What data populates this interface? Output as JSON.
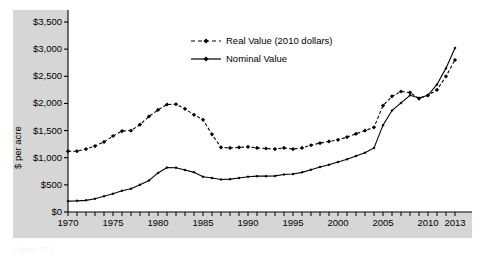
{
  "figure": {
    "panel_color": "#d6d6d6",
    "plot_bg": "#ffffff",
    "line_color": "#000000",
    "caption": "Figure 22.1"
  },
  "legend": {
    "position": "top-center",
    "entries": [
      {
        "label": "Real Value (2010 dollars)",
        "style": "dashed",
        "marker": "diamond"
      },
      {
        "label": "Nominal Value",
        "style": "solid",
        "marker": "diamond"
      }
    ]
  },
  "axes": {
    "ylabel": "$ per acre",
    "yticks": [
      "$0",
      "$500",
      "$1,000",
      "$1,500",
      "$2,000",
      "$2,500",
      "$3,000",
      "$3,500"
    ],
    "xticks": [
      "1970",
      "1975",
      "1980",
      "1985",
      "1990",
      "1995",
      "2000",
      "2005",
      "2010",
      "2013"
    ]
  },
  "chart_data": {
    "type": "line",
    "title": "",
    "xlabel": "",
    "ylabel": "$ per acre",
    "xlim": [
      1970,
      2013
    ],
    "ylim": [
      0,
      3500
    ],
    "ytick_values": [
      0,
      500,
      1000,
      1500,
      2000,
      2500,
      3000,
      3500
    ],
    "xtick_values": [
      1970,
      1975,
      1980,
      1985,
      1990,
      1995,
      2000,
      2005,
      2010,
      2013
    ],
    "grid": false,
    "legend_position": "top-center",
    "x": [
      1970,
      1971,
      1972,
      1973,
      1974,
      1975,
      1976,
      1977,
      1978,
      1979,
      1980,
      1981,
      1982,
      1983,
      1984,
      1985,
      1986,
      1987,
      1988,
      1989,
      1990,
      1991,
      1992,
      1993,
      1994,
      1995,
      1996,
      1997,
      1998,
      1999,
      2000,
      2001,
      2002,
      2003,
      2004,
      2005,
      2006,
      2007,
      2008,
      2009,
      2010,
      2011,
      2012,
      2013
    ],
    "series": [
      {
        "name": "Real Value (2010 dollars)",
        "style": "dashed",
        "marker": "diamond",
        "values": [
          1120,
          1120,
          1160,
          1215,
          1290,
          1400,
          1490,
          1500,
          1610,
          1760,
          1880,
          1980,
          1985,
          1900,
          1790,
          1700,
          1430,
          1190,
          1180,
          1190,
          1200,
          1180,
          1170,
          1160,
          1180,
          1160,
          1180,
          1230,
          1270,
          1300,
          1330,
          1380,
          1440,
          1500,
          1560,
          1960,
          2130,
          2220,
          2200,
          2090,
          2150,
          2250,
          2500,
          2800
        ]
      },
      {
        "name": "Nominal Value",
        "style": "solid",
        "marker": "diamond",
        "values": [
          200,
          205,
          215,
          245,
          290,
          335,
          390,
          430,
          500,
          580,
          720,
          820,
          815,
          775,
          730,
          650,
          625,
          600,
          605,
          625,
          650,
          660,
          660,
          665,
          690,
          700,
          730,
          780,
          830,
          870,
          920,
          970,
          1030,
          1090,
          1180,
          1600,
          1870,
          2010,
          2150,
          2100,
          2150,
          2350,
          2650,
          3020
        ]
      }
    ]
  }
}
